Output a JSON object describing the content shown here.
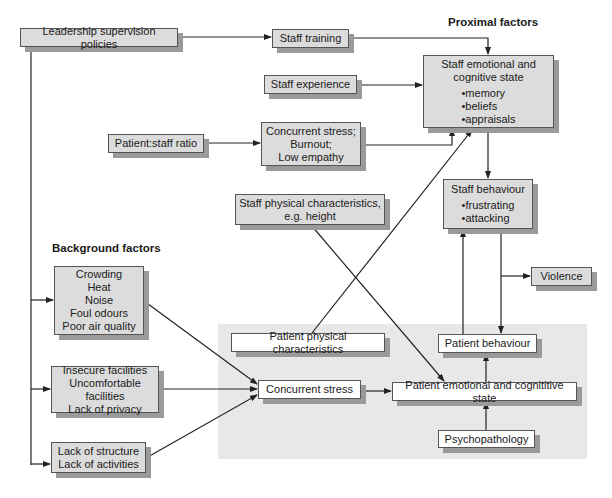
{
  "headings": {
    "proximal": "Proximal factors",
    "background": "Background factors"
  },
  "nodes": {
    "leadership": {
      "label": "Leadership supervision policies"
    },
    "staff_training": {
      "label": "Staff training"
    },
    "staff_experience": {
      "label": "Staff experience"
    },
    "patient_staff_ratio": {
      "label": "Patient:staff ratio"
    },
    "concurrent_stress_staff": {
      "lines": [
        "Concurrent stress;",
        "Burnout;",
        "Low empathy"
      ]
    },
    "staff_emotional": {
      "title_lines": [
        "Staff emotional and",
        "cognitive state"
      ],
      "bullets": [
        "memory",
        "beliefs",
        "appraisals"
      ]
    },
    "staff_behaviour": {
      "title": "Staff behaviour",
      "bullets": [
        "frustrating",
        "attacking"
      ]
    },
    "staff_physical": {
      "lines": [
        "Staff physical characteristics,",
        "e.g. height"
      ]
    },
    "violence": {
      "label": "Violence"
    },
    "crowding": {
      "lines": [
        "Crowding",
        "Heat",
        "Noise",
        "Foul odours",
        "Poor air quality"
      ]
    },
    "facilities": {
      "lines": [
        "Insecure facilities",
        "Uncomfortable facilities",
        "Lack of privacy"
      ]
    },
    "structure": {
      "lines": [
        "Lack of structure",
        "Lack of activities"
      ]
    },
    "patient_physical": {
      "label": "Patient physical characteristics"
    },
    "concurrent_stress": {
      "label": "Concurrent stress"
    },
    "patient_emotional": {
      "label": "Patient emotional and cognititive state"
    },
    "patient_behaviour": {
      "label": "Patient behaviour"
    },
    "psychopathology": {
      "label": "Psychopathology"
    }
  },
  "colors": {
    "box_fill": "#dcdcdc",
    "patient_region": "#e8e8e8",
    "shadow": "#9a9a9a",
    "line": "#222222"
  }
}
